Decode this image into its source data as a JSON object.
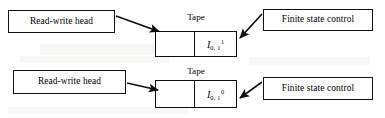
{
  "figure": {
    "type": "turing-machine-diagram",
    "background_color": "#ffffff",
    "line_color": "#0d0d0d",
    "rows": [
      {
        "id": "row-top",
        "read_write_head_label": "Read-write head",
        "tape_caption": "Tape",
        "finite_state_control_label": "Finite state control",
        "tape_cells": [
          {
            "symbol": "",
            "subscript": "",
            "superscript": ""
          },
          {
            "symbol": "I",
            "subscript": "0, 1",
            "superscript": "1"
          }
        ]
      },
      {
        "id": "row-bottom",
        "read_write_head_label": "Read-write head",
        "tape_caption": "Tape",
        "finite_state_control_label": "Finite state control",
        "tape_cells": [
          {
            "symbol": "",
            "subscript": "",
            "superscript": ""
          },
          {
            "symbol": "I",
            "subscript": "0, 1",
            "superscript": "0"
          }
        ]
      }
    ],
    "arrows": [
      {
        "name": "head-to-tape-top",
        "from": "read-write-head-top",
        "to": "tape-cell-top-left"
      },
      {
        "name": "control-to-tape-top",
        "from": "finite-state-control-top",
        "to": "tape-cell-top-right"
      },
      {
        "name": "head-to-tape-bottom",
        "from": "read-write-head-bottom",
        "to": "tape-cell-bottom-left"
      },
      {
        "name": "control-to-tape-bottom",
        "from": "finite-state-control-bottom",
        "to": "tape-cell-bottom-right"
      }
    ]
  }
}
